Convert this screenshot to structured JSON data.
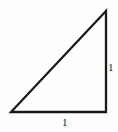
{
  "figure": {
    "kind": "geometry-diagram",
    "canvas": {
      "width": 118,
      "height": 132
    },
    "background_color": "#fefefe",
    "stroke_color": "#1a1a1a",
    "stroke_width": 2.3,
    "shape": {
      "name": "right-triangle",
      "vertices": [
        {
          "name": "apex",
          "x": 106,
          "y": 11
        },
        {
          "name": "bottom-left",
          "x": 11,
          "y": 112
        },
        {
          "name": "bottom-right",
          "x": 106,
          "y": 112
        }
      ],
      "right_angle_at": "bottom-right"
    },
    "labels": {
      "vertical_leg": "1",
      "horizontal_leg": "1"
    }
  }
}
